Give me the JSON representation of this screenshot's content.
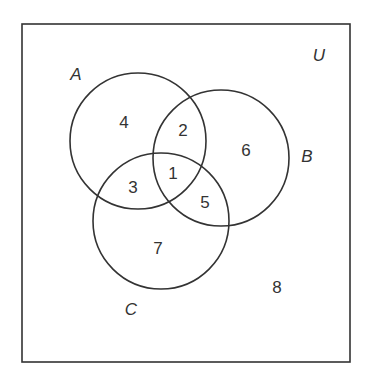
{
  "diagram": {
    "type": "venn",
    "universe_label": "U",
    "sets": [
      {
        "label": "A",
        "cx": 138,
        "cy": 141,
        "r": 68,
        "label_x": 76,
        "label_y": 80
      },
      {
        "label": "B",
        "cx": 221,
        "cy": 158,
        "r": 68,
        "label_x": 307,
        "label_y": 162
      },
      {
        "label": "C",
        "cx": 161,
        "cy": 221,
        "r": 68,
        "label_x": 131,
        "label_y": 315
      }
    ],
    "regions": [
      {
        "id": "A_only",
        "value": "4",
        "x": 124,
        "y": 128
      },
      {
        "id": "A_B",
        "value": "2",
        "x": 183,
        "y": 136
      },
      {
        "id": "B_only",
        "value": "6",
        "x": 246,
        "y": 156
      },
      {
        "id": "A_B_C",
        "value": "1",
        "x": 173,
        "y": 179
      },
      {
        "id": "A_C",
        "value": "3",
        "x": 133,
        "y": 193
      },
      {
        "id": "B_C",
        "value": "5",
        "x": 205,
        "y": 208
      },
      {
        "id": "C_only",
        "value": "7",
        "x": 158,
        "y": 254
      },
      {
        "id": "outside",
        "value": "8",
        "x": 277,
        "y": 293
      }
    ],
    "universe": {
      "x": 22,
      "y": 24,
      "width": 328,
      "height": 338,
      "label_x": 319,
      "label_y": 61
    },
    "stroke_color": "#333333"
  }
}
